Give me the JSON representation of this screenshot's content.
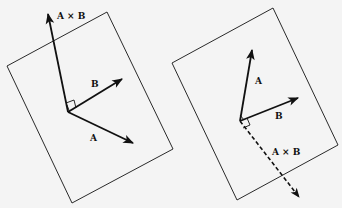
{
  "figures": [
    {
      "id": "left",
      "description": "A × B points up out of plane containing A and B",
      "labels": {
        "cross": "A × B",
        "a": "A",
        "b": "B"
      }
    },
    {
      "id": "right",
      "description": "A × B points down (dashed) below plane containing A and B",
      "labels": {
        "cross": "A × B",
        "a": "A",
        "b": "B"
      }
    }
  ],
  "colors": {
    "line": "#111111",
    "background": "#f4f4f4"
  }
}
